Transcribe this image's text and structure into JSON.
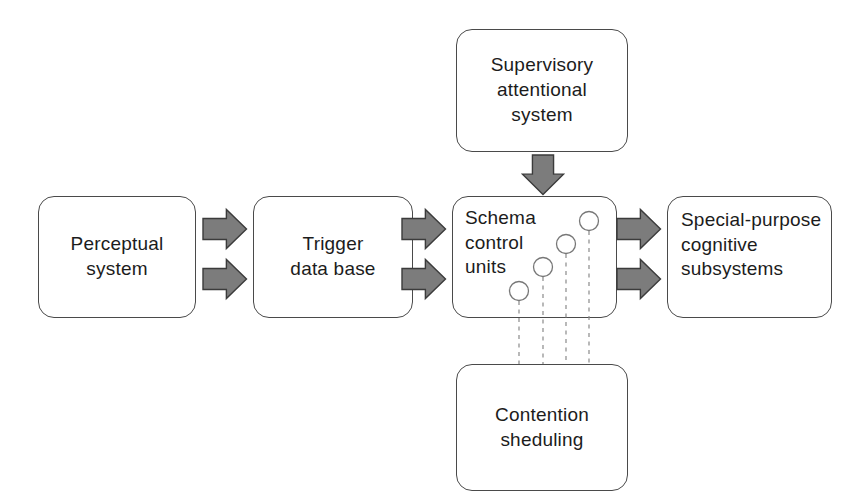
{
  "diagram": {
    "background_color": "#ffffff",
    "canvas": {
      "width": 865,
      "height": 502
    },
    "box_style": {
      "fill": "#ffffff",
      "border_color": "#4a4a4a",
      "corner_radius_px": 16
    },
    "arrow_style": {
      "fill": "#7c7c7c",
      "outline_color": "#3b3b3b"
    },
    "unit_style": {
      "circle_fill": "#ffffff",
      "circle_stroke": "#777777",
      "dash_stroke": "#8a8a8a"
    }
  },
  "nodes": {
    "perceptual_system": {
      "label": "Perceptual\nsystem",
      "x": 38,
      "y": 196,
      "width": 158,
      "height": 122,
      "align": "center"
    },
    "trigger_data_base": {
      "label": "Trigger\ndata base",
      "x": 253,
      "y": 196,
      "width": 160,
      "height": 122,
      "align": "center"
    },
    "schema_control_units": {
      "label": "Schema\ncontrol\nunits",
      "x": 452,
      "y": 196,
      "width": 165,
      "height": 122,
      "align": "topleft"
    },
    "special_purpose_cognitive_subsystems": {
      "label": "Special-purpose\ncognitive\nsubsystems",
      "x": 667,
      "y": 196,
      "width": 165,
      "height": 122,
      "align": "left"
    },
    "supervisory_attentional_system": {
      "label": "Supervisory\nattentional\nsystem",
      "x": 456,
      "y": 29,
      "width": 172,
      "height": 123,
      "align": "center"
    },
    "contention_sheduling": {
      "label": "Contention\nsheduling",
      "x": 456,
      "y": 364,
      "width": 172,
      "height": 127,
      "align": "center"
    }
  },
  "arrows": [
    {
      "name": "perceptual-to-trigger-upper",
      "direction": "right",
      "x": 202,
      "y": 208,
      "length": 46,
      "thickness": 42
    },
    {
      "name": "perceptual-to-trigger-lower",
      "direction": "right",
      "x": 202,
      "y": 258,
      "length": 46,
      "thickness": 42
    },
    {
      "name": "trigger-to-schema-upper",
      "direction": "right",
      "x": 401,
      "y": 208,
      "length": 46,
      "thickness": 42
    },
    {
      "name": "trigger-to-schema-lower",
      "direction": "right",
      "x": 401,
      "y": 258,
      "length": 46,
      "thickness": 42
    },
    {
      "name": "schema-to-subsystems-upper",
      "direction": "right",
      "x": 616,
      "y": 208,
      "length": 46,
      "thickness": 42
    },
    {
      "name": "schema-to-subsystems-lower",
      "direction": "right",
      "x": 616,
      "y": 258,
      "length": 46,
      "thickness": 42
    },
    {
      "name": "supervisory-to-schema",
      "direction": "down",
      "x": 521,
      "y": 154,
      "length": 42,
      "thickness": 44
    }
  ],
  "schema_units": {
    "circle_radius": 9.5,
    "circles": [
      {
        "name": "schema-unit-1",
        "cx": 519,
        "cy": 291
      },
      {
        "name": "schema-unit-2",
        "cx": 543,
        "cy": 267
      },
      {
        "name": "schema-unit-3",
        "cx": 566,
        "cy": 244
      },
      {
        "name": "schema-unit-4",
        "cx": 589,
        "cy": 221
      }
    ],
    "dashed_lines": [
      {
        "name": "schema-unit-link-1",
        "x": 519,
        "y_start": 301,
        "y_end": 364
      },
      {
        "name": "schema-unit-link-2",
        "x": 543,
        "y_start": 277,
        "y_end": 364
      },
      {
        "name": "schema-unit-link-3",
        "x": 566,
        "y_start": 254,
        "y_end": 364
      },
      {
        "name": "schema-unit-link-4",
        "x": 589,
        "y_start": 231,
        "y_end": 364
      }
    ]
  }
}
